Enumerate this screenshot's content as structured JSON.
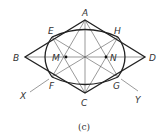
{
  "figure": {
    "caption": "(c)",
    "colors": {
      "line": "#222222",
      "construction": "#555555",
      "background": "#ffffff"
    },
    "points": {
      "A": {
        "label": "A",
        "x": 85,
        "y": 20
      },
      "B": {
        "label": "B",
        "x": 25,
        "y": 57
      },
      "C": {
        "label": "C",
        "x": 85,
        "y": 93
      },
      "D": {
        "label": "D",
        "x": 145,
        "y": 57
      },
      "E": {
        "label": "E",
        "x": 52,
        "y": 37
      },
      "H": {
        "label": "H",
        "x": 118,
        "y": 37
      },
      "F": {
        "label": "F",
        "x": 52,
        "y": 77
      },
      "G": {
        "label": "G",
        "x": 118,
        "y": 77
      },
      "M": {
        "label": "M",
        "x": 66,
        "y": 57
      },
      "N": {
        "label": "N",
        "x": 106,
        "y": 57
      },
      "X": {
        "label": "X"
      },
      "Y": {
        "label": "Y"
      }
    }
  }
}
